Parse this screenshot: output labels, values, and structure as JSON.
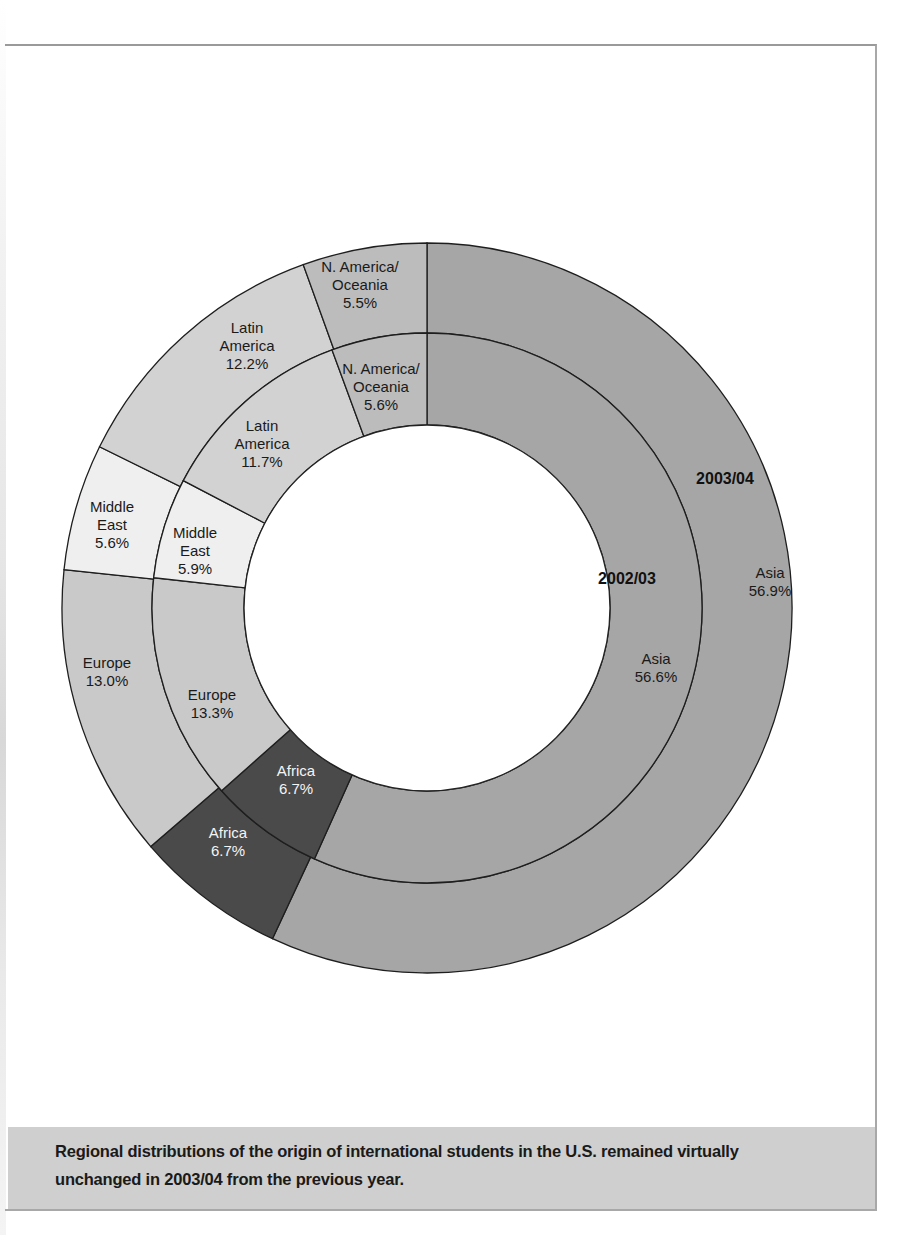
{
  "chart_data": {
    "type": "pie",
    "subtype": "nested-donut",
    "title": "",
    "center": [
      427,
      608
    ],
    "radii": {
      "outer": 365,
      "middle": 275,
      "inner": 183
    },
    "start_angle_deg": 0,
    "direction": "clockwise",
    "categories": [
      "Asia",
      "Africa",
      "Europe",
      "Middle East",
      "Latin America",
      "N. America/Oceania"
    ],
    "colors": {
      "Asia": "#a6a6a6",
      "Africa": "#4a4a4a",
      "Europe": "#c9c9c9",
      "Middle East": "#efefef",
      "Latin America": "#d2d2d2",
      "N. America/Oceania": "#bcbcbc"
    },
    "series": [
      {
        "name": "2003/04",
        "ring": "outer",
        "values": [
          56.9,
          6.7,
          13.0,
          5.6,
          12.2,
          5.5
        ],
        "labels": [
          {
            "lines": [
              "Asia",
              "56.9%"
            ],
            "x": 770,
            "y": 578,
            "color": "dark"
          },
          {
            "lines": [
              "Africa",
              "6.7%"
            ],
            "x": 228,
            "y": 838,
            "color": "light"
          },
          {
            "lines": [
              "Europe",
              "13.0%"
            ],
            "x": 107,
            "y": 668,
            "color": "dark"
          },
          {
            "lines": [
              "Middle",
              "East",
              "5.6%"
            ],
            "x": 112,
            "y": 512,
            "color": "dark"
          },
          {
            "lines": [
              "Latin",
              "America",
              "12.2%"
            ],
            "x": 247,
            "y": 333,
            "color": "dark"
          },
          {
            "lines": [
              "N. America/",
              "Oceania",
              "5.5%"
            ],
            "x": 360,
            "y": 272,
            "color": "dark"
          }
        ],
        "year_label": {
          "text": "2003/04",
          "x": 725,
          "y": 484
        }
      },
      {
        "name": "2002/03",
        "ring": "inner",
        "values": [
          56.6,
          6.7,
          13.3,
          5.9,
          11.7,
          5.6
        ],
        "labels": [
          {
            "lines": [
              "Asia",
              "56.6%"
            ],
            "x": 656,
            "y": 664,
            "color": "dark"
          },
          {
            "lines": [
              "Africa",
              "6.7%"
            ],
            "x": 296,
            "y": 776,
            "color": "light"
          },
          {
            "lines": [
              "Europe",
              "13.3%"
            ],
            "x": 212,
            "y": 700,
            "color": "dark"
          },
          {
            "lines": [
              "Middle",
              "East",
              "5.9%"
            ],
            "x": 195,
            "y": 538,
            "color": "dark"
          },
          {
            "lines": [
              "Latin",
              "America",
              "11.7%"
            ],
            "x": 262,
            "y": 431,
            "color": "dark"
          },
          {
            "lines": [
              "N. America/",
              "Oceania",
              "5.6%"
            ],
            "x": 381,
            "y": 374,
            "color": "dark"
          }
        ],
        "year_label": {
          "text": "2002/03",
          "x": 627,
          "y": 584
        }
      }
    ],
    "legend": "none",
    "caption": "Regional distributions of the origin of international students in the U.S. remained virtually unchanged in 2003/04 from the previous year."
  },
  "caption": {
    "text": "Regional distributions of the origin of international students in the U.S. remained virtually unchanged in 2003/04 from the previous year."
  },
  "labels": {
    "year_outer": "2003/04",
    "year_inner": "2002/03"
  }
}
